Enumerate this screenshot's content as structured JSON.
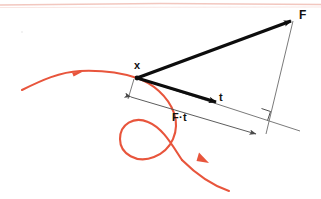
{
  "figure": {
    "width": 321,
    "height": 199,
    "background_color": "#ffffff",
    "top_rule_color": "#f0bdb4"
  },
  "colors": {
    "trajectory": "#e8553c",
    "vector": "#0d0d0d",
    "thin_line": "#6b6b6b",
    "dimension_line": "#4a4a4a",
    "label": "#111111"
  },
  "labels": {
    "force_vector": "F",
    "point": "x",
    "time_vector": "t",
    "impulse": "F·t"
  },
  "label_positions": {
    "force_vector": {
      "x": 299,
      "y": 19
    },
    "point": {
      "x": 134,
      "y": 69
    },
    "time_vector": {
      "x": 219,
      "y": 101
    },
    "impulse": {
      "x": 172,
      "y": 121
    }
  },
  "geometry": {
    "origin_point": {
      "x": 137,
      "y": 78
    },
    "force_tip": {
      "x": 293,
      "y": 20
    },
    "time_tip": {
      "x": 219,
      "y": 103
    },
    "time_line_end": {
      "x": 288,
      "y": 129
    },
    "perpendicular_foot": {
      "x": 266,
      "y": 133
    },
    "dimension_start": {
      "x": 130,
      "y": 97
    },
    "dimension_end": {
      "x": 258,
      "y": 135
    },
    "right_angle_marker": {
      "x": 262,
      "y": 112
    }
  },
  "trajectory": {
    "type": "spiral-curve",
    "entry_point": {
      "x": 22,
      "y": 90
    },
    "entry_arrow": {
      "x": 79,
      "y": 72
    },
    "loop_center": {
      "x": 150,
      "y": 148
    },
    "loop_radius": 24,
    "exit_arrow": {
      "x": 205,
      "y": 159
    },
    "exit_point": {
      "x": 229,
      "y": 191
    }
  }
}
